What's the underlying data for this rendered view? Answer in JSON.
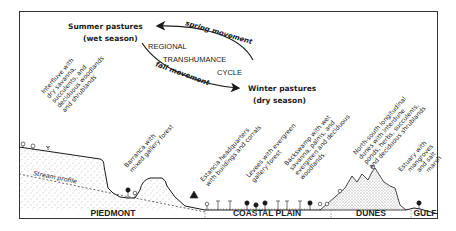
{
  "cycle": {
    "summer_title": "Summer pastures",
    "summer_sub": "(wet season)",
    "winter_title": "Winter pastures",
    "winter_sub": "(dry season)",
    "center_line1": "REGIONAL",
    "center_line2": "TRANSHUMANCE",
    "center_line3": "CYCLE",
    "spring": "spring movement",
    "fall": "fall movement"
  },
  "annotations": {
    "interfluve": [
      "Interfluve with",
      "dry savanna,",
      "succulents, and",
      "deciduous woodlands",
      "and shrublands"
    ],
    "barranca": [
      "Barranca with",
      "mixed gallery forest"
    ],
    "estancia": [
      "Estancia headquarters",
      "with buildings and corrals"
    ],
    "levees": [
      "Levees with evergreen",
      "gallery forest"
    ],
    "backswamp": [
      "Backswamp with wet",
      "savanna, palms, and",
      "evergreen and deciduous",
      "woodlands"
    ],
    "dunes": [
      "North-south longitudinal",
      "dunes with interdune",
      "ponds, herbs, succulents,",
      "and deciduous shrublands"
    ],
    "estuary": [
      "Estuary with",
      "mangroves",
      "and salt",
      "marsh"
    ],
    "stream_profile": "Stream profile"
  },
  "regions": [
    "PIEDMONT",
    "COASTAL PLAIN",
    "DUNES",
    "GULF"
  ],
  "colors": {
    "ink": "#1a1a1a",
    "stipple": "#777777",
    "frame": "#333333"
  }
}
